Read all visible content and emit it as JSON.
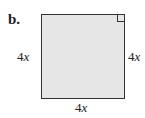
{
  "part_label": "b.",
  "shape": "square",
  "right_angle_marker": "top-right",
  "sides": {
    "left": {
      "coef": "4",
      "var": "x"
    },
    "right": {
      "coef": "4",
      "var": "x"
    },
    "bottom": {
      "coef": "4",
      "var": "x"
    }
  },
  "colors": {
    "fill": "#e6e6e6",
    "stroke": "#333333"
  }
}
